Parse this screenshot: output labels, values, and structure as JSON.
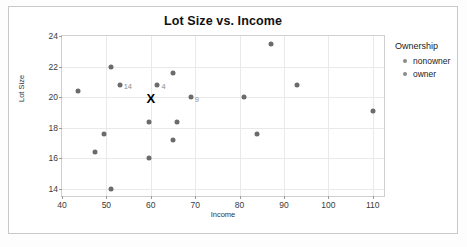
{
  "chart_data": {
    "type": "scatter",
    "title": "Lot Size vs. Income",
    "xlabel": "Income",
    "ylabel": "Lot Size",
    "xlim": [
      40,
      113
    ],
    "ylim": [
      13.4,
      24
    ],
    "xticks": [
      40,
      50,
      60,
      70,
      80,
      90,
      100,
      110
    ],
    "yticks": [
      14,
      16,
      18,
      20,
      22,
      24
    ],
    "grid": true,
    "legend": {
      "title": "Ownership",
      "position": "right",
      "entries": [
        {
          "label": "nonowner",
          "color": "#8a8a8a"
        },
        {
          "label": "owner",
          "color": "#8a8a8a"
        }
      ]
    },
    "point_color": "#6b6b6b",
    "points": [
      {
        "x": 43.5,
        "y": 20.4,
        "label": ""
      },
      {
        "x": 47.5,
        "y": 16.4,
        "label": ""
      },
      {
        "x": 49.5,
        "y": 17.6,
        "label": ""
      },
      {
        "x": 51.0,
        "y": 22.0,
        "label": ""
      },
      {
        "x": 51.0,
        "y": 14.0,
        "label": ""
      },
      {
        "x": 53.0,
        "y": 20.8,
        "label": "14"
      },
      {
        "x": 59.5,
        "y": 18.4,
        "label": ""
      },
      {
        "x": 59.5,
        "y": 16.0,
        "label": ""
      },
      {
        "x": 61.5,
        "y": 20.8,
        "label": "4"
      },
      {
        "x": 65.0,
        "y": 21.6,
        "label": ""
      },
      {
        "x": 66.0,
        "y": 18.4,
        "label": ""
      },
      {
        "x": 65.0,
        "y": 17.2,
        "label": ""
      },
      {
        "x": 69.0,
        "y": 20.0,
        "label": "9"
      },
      {
        "x": 81.0,
        "y": 20.0,
        "label": ""
      },
      {
        "x": 84.0,
        "y": 17.6,
        "label": ""
      },
      {
        "x": 87.0,
        "y": 23.5,
        "label": ""
      },
      {
        "x": 93.0,
        "y": 20.8,
        "label": ""
      },
      {
        "x": 110.0,
        "y": 19.1,
        "label": ""
      }
    ],
    "markers": [
      {
        "symbol": "X",
        "x": 60.0,
        "y": 19.95,
        "color": "#000000"
      }
    ]
  }
}
